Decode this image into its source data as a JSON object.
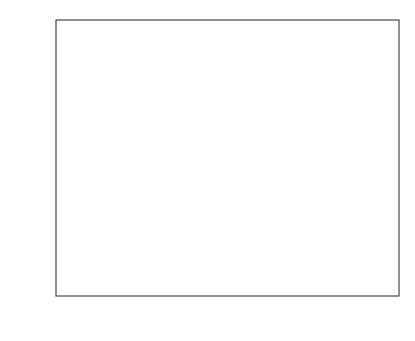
{
  "chart_data": {
    "type": "line",
    "title": "",
    "xlabel": "ρ",
    "ylabel": "Bit error rate",
    "xlim": [
      0,
      1
    ],
    "ylim": [
      1e-06,
      1
    ],
    "yscale": "log",
    "grid": false,
    "legend_position": "lower right",
    "x_ticks": [
      "0",
      "0.1",
      "0.2",
      "0.3",
      "0.4",
      "0.5",
      "0.6",
      "0.7",
      "0.8",
      "0.9",
      "1"
    ],
    "y_ticks": [
      {
        "base": "10",
        "exp": "0",
        "value": 1
      },
      {
        "base": "10",
        "exp": "-1",
        "value": 0.1
      },
      {
        "base": "10",
        "exp": "-2",
        "value": 0.01
      },
      {
        "base": "10",
        "exp": "-3",
        "value": 0.001
      },
      {
        "base": "10",
        "exp": "-4",
        "value": 0.0001
      },
      {
        "base": "10",
        "exp": "-5",
        "value": 1e-05
      },
      {
        "base": "10",
        "exp": "-6",
        "value": 1e-06
      }
    ],
    "series": [
      {
        "name": "β_h = 10 dB, β_g = 10 dB",
        "eta": 0.3,
        "style": "dotted",
        "color": "#888888",
        "x": [
          0.0,
          0.02,
          0.05,
          0.08,
          0.1,
          0.12,
          0.14,
          0.16,
          0.18,
          0.2,
          0.25,
          0.3,
          0.4,
          0.5,
          0.6,
          0.7,
          0.8,
          0.9,
          0.95,
          0.98
        ],
        "y": [
          0.15,
          0.06,
          0.009,
          0.0012,
          0.00035,
          9e-05,
          3e-05,
          1.6e-05,
          1.2e-05,
          1.2e-05,
          1.5e-05,
          2e-05,
          4.5e-05,
          0.00011,
          0.0003,
          0.001,
          0.0045,
          0.028,
          0.09,
          0.2
        ]
      },
      {
        "name": "β_h = 10 dB, β_g = 0 dB",
        "eta": 0.3,
        "style": "dashed",
        "color": "#555555",
        "x": [
          0.0,
          0.1,
          0.2,
          0.3,
          0.4,
          0.5,
          0.6,
          0.65,
          0.7,
          0.75,
          0.8,
          0.85,
          0.9,
          0.95,
          0.98
        ],
        "y": [
          0.4,
          0.17,
          0.08,
          0.035,
          0.016,
          0.0078,
          0.0044,
          0.0034,
          0.003,
          0.0033,
          0.0055,
          0.011,
          0.03,
          0.09,
          0.2
        ]
      },
      {
        "name": "β_h = 10 dB, β_g = 10 dB",
        "eta": 0.5,
        "style": "solid",
        "color": "#333333",
        "x": [
          0.0,
          0.02,
          0.04,
          0.06,
          0.08,
          0.09,
          0.1,
          0.11,
          0.12,
          0.14,
          0.16,
          0.2,
          0.25,
          0.3,
          0.4,
          0.5,
          0.6,
          0.7,
          0.8,
          0.9,
          0.95,
          0.98
        ],
        "y": [
          0.1,
          0.025,
          0.003,
          0.00035,
          5e-05,
          2.2e-05,
          1.2e-05,
          8.5e-06,
          7.8e-06,
          8.5e-06,
          9.5e-06,
          1.2e-05,
          1.5e-05,
          2e-05,
          4.5e-05,
          0.00011,
          0.0003,
          0.001,
          0.0045,
          0.028,
          0.09,
          0.2
        ]
      },
      {
        "name": "β_h = 10 dB, β_g = 0 dB",
        "eta": 0.5,
        "style": "dashed",
        "color": "#aaaaaa",
        "x": [
          0.0,
          0.1,
          0.2,
          0.3,
          0.4,
          0.5,
          0.55,
          0.6,
          0.65,
          0.7,
          0.75,
          0.8,
          0.85,
          0.9,
          0.95,
          0.98
        ],
        "y": [
          0.35,
          0.09,
          0.025,
          0.008,
          0.0027,
          0.0011,
          0.00075,
          0.00062,
          0.00065,
          0.0009,
          0.0017,
          0.0045,
          0.011,
          0.03,
          0.09,
          0.2
        ]
      }
    ],
    "annotations": [
      {
        "text": "η = 0.5",
        "target_series": 3,
        "arrow_tip": [
          0.23,
          0.016
        ],
        "label_at": [
          0.21,
          0.0045
        ]
      },
      {
        "text": "η = 0.3",
        "target_series": 1,
        "arrow_tip": [
          0.525,
          0.0064
        ],
        "label_at": [
          0.535,
          0.022
        ]
      },
      {
        "text": "η = 0.3",
        "target_series": 0,
        "arrow_tip": [
          0.14,
          3.5e-05
        ],
        "label_at": [
          0.2,
          0.00018
        ]
      },
      {
        "text": "η = 0.5",
        "target_series": 2,
        "arrow_tip": [
          0.085,
          1.9e-05
        ],
        "label_at": [
          0.06,
          2.8e-06
        ]
      }
    ]
  }
}
